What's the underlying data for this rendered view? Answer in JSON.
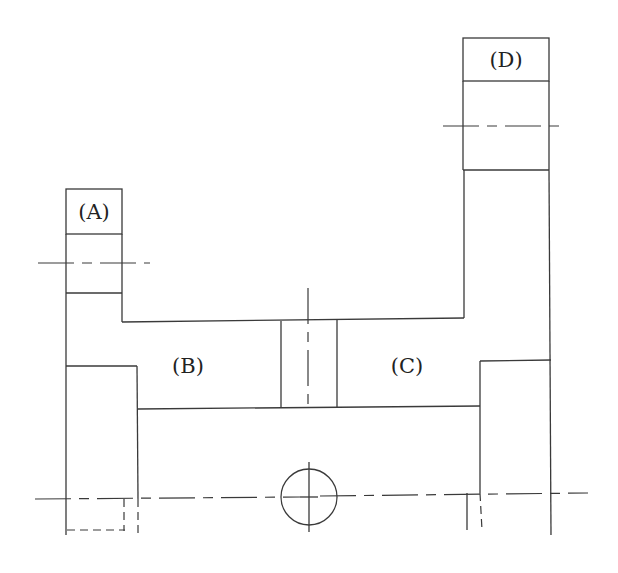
{
  "diagram": {
    "type": "mechanical-cross-section",
    "colors": {
      "line": "#3a3a3a",
      "background": "#ffffff",
      "text": "#222222"
    },
    "labels": [
      {
        "id": "A",
        "text": "(A)",
        "x": 94,
        "y": 212
      },
      {
        "id": "B",
        "text": "(B)",
        "x": 188,
        "y": 366
      },
      {
        "id": "C",
        "text": "(C)",
        "x": 407,
        "y": 366
      },
      {
        "id": "D",
        "text": "(D)",
        "x": 506,
        "y": 60
      }
    ],
    "parts": {
      "A": "left upper block",
      "B": "left inner chamber",
      "C": "right inner chamber",
      "D": "right upper block"
    }
  }
}
